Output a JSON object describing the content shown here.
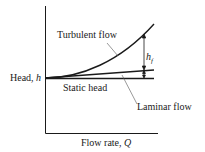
{
  "diagram": {
    "y_axis_label": "Head, ",
    "y_axis_var": "h",
    "x_axis_label": "Flow rate, ",
    "x_axis_var": "Q",
    "curves": {
      "turbulent": "Turbulent flow",
      "laminar": "Laminar flow",
      "static": "Static head"
    },
    "head_loss_label": "h",
    "head_loss_sub": "f",
    "colors": {
      "line": "#1a1a1a",
      "background": "#ffffff"
    }
  }
}
